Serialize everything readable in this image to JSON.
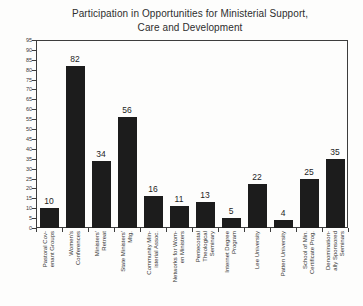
{
  "chart_data": {
    "type": "bar",
    "title": "Participation in Opportunities for Ministerial Support, Care and Development",
    "title_lines": [
      "Participation in Opportunities for Ministerial Support,",
      "Care and Development"
    ],
    "categories": [
      "Pastoral Cov-\nenant Groups",
      "Women's\nConferences",
      "Ministers'\nRetreat",
      "State Ministers'\nMtg.",
      "Community Min-\nisterial Assoc.",
      "Networks for Wom-\nen Ministers",
      "Pentecostal\nTheological\nSeminary",
      "Internet Degree\nProgram",
      "Lee University",
      "Patten University",
      "School of Min.\nCertificate Prog.",
      "Denomination-\nally Sponsored\nSeminars"
    ],
    "values": [
      10,
      82,
      34,
      56,
      16,
      11,
      13,
      5,
      22,
      4,
      25,
      35
    ],
    "xlabel": "",
    "ylabel": "",
    "ylim": [
      0,
      95
    ],
    "ytick_step": 5,
    "grid": false,
    "legend": null,
    "data_labels": true,
    "bar_color": "#1c1c1c",
    "axis_color": "#3d3d3d",
    "text_color": "#2e2e2e",
    "background_color": "#fdfdfc"
  }
}
